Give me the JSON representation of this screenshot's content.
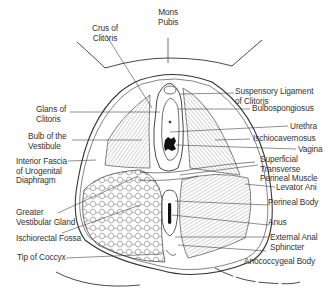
{
  "diagram": {
    "labels": {
      "mons_pubis": [
        "Mons",
        "Pubis"
      ],
      "crus_of_clitoris": [
        "Crus of",
        "Clitoris"
      ],
      "glans_of_clitoris": [
        "Glans of",
        "Clitoris"
      ],
      "bulb_of_vestibule": [
        "Bulb of the",
        "Vestibule"
      ],
      "interior_fascia": [
        "Interior Fascia",
        "of Urogenital",
        "Diaphragm"
      ],
      "greater_vestibular_gland": [
        "Greater",
        "Vestibular Gland"
      ],
      "ischiorectal_fossa": [
        "Ischiorectal Fossa"
      ],
      "tip_of_coccyx": [
        "Tip of Coccyx"
      ],
      "suspensory_ligament": [
        "Suspensory Ligament",
        "of Clitoris"
      ],
      "bulbospongiosus": [
        "Bulbospongiosus"
      ],
      "urethra": [
        "Urethra"
      ],
      "ischiocavernosus": [
        "Ischiocavernosus"
      ],
      "vagina": [
        "Vagina"
      ],
      "superficial_transverse": [
        "Superficial",
        "Transverse",
        "Perineal Muscle"
      ],
      "levator_ani": [
        "Levator Ani"
      ],
      "perineal_body": [
        "Perineal Body"
      ],
      "anus": [
        "Anus"
      ],
      "external_anal_sphincter": [
        "External Anal",
        "Sphincter"
      ],
      "anococcygeal_body": [
        "Anococcygeal Body"
      ]
    }
  }
}
